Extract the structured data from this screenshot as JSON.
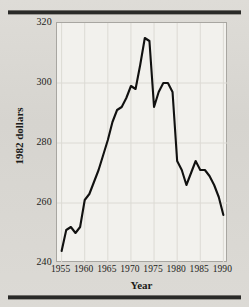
{
  "chart_data": {
    "type": "line",
    "title": "",
    "xlabel": "Year",
    "ylabel": "1982 dollars",
    "xlim": [
      1954,
      1991
    ],
    "ylim": [
      240,
      320
    ],
    "grid": true,
    "legend": "none",
    "line_color": "#111110",
    "plot_background": "#f2f1ed",
    "xticks": [
      1955,
      1960,
      1965,
      1970,
      1975,
      1980,
      1985,
      1990
    ],
    "xtick_labels": [
      "1955",
      "1960",
      "1965",
      "1970",
      "1975",
      "1980",
      "1985",
      "1990"
    ],
    "yticks": [
      240,
      260,
      280,
      300,
      320
    ],
    "ytick_labels": [
      "240",
      "260",
      "280",
      "300",
      "320"
    ],
    "series": [
      {
        "name": "real weekly earnings",
        "x": [
          1955,
          1956,
          1957,
          1958,
          1959,
          1960,
          1961,
          1962,
          1963,
          1964,
          1965,
          1966,
          1967,
          1968,
          1969,
          1970,
          1971,
          1972,
          1973,
          1974,
          1975,
          1976,
          1977,
          1978,
          1979,
          1980,
          1981,
          1982,
          1983,
          1984,
          1985,
          1986,
          1987,
          1988,
          1989,
          1990
        ],
        "values": [
          244,
          251,
          252,
          250,
          252,
          261,
          263,
          267,
          271,
          276,
          281,
          287,
          291,
          292,
          295,
          299,
          298,
          306,
          315,
          314,
          292,
          297,
          300,
          300,
          297,
          274,
          271,
          266,
          270,
          274,
          271,
          271,
          269,
          266,
          262,
          256
        ]
      }
    ]
  },
  "figure": {
    "rule_top": "horizontal-rule",
    "rule_bottom": "horizontal-rule"
  }
}
